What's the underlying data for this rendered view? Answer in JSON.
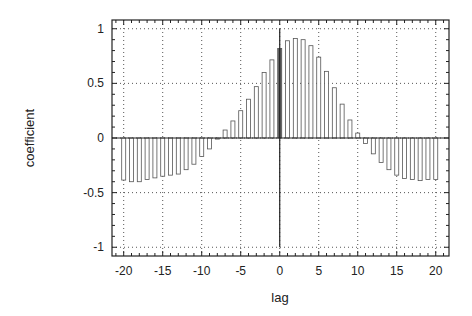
{
  "chart_data": {
    "type": "bar",
    "title": "",
    "xlabel": "lag",
    "ylabel": "coefficient",
    "xlim": [
      -21.5,
      21.7
    ],
    "ylim": [
      -1.08,
      1.08
    ],
    "xticks": [
      -20,
      -15,
      -10,
      -5,
      0,
      5,
      10,
      15,
      20
    ],
    "xtick_labels": [
      "-20",
      "-15",
      "-10",
      "-5",
      "0",
      "5",
      "10",
      "15",
      "20"
    ],
    "yticks": [
      1,
      0.5,
      0,
      -0.5,
      -1
    ],
    "ytick_labels": [
      "1",
      "0.5",
      "0",
      "-0.5",
      "-1"
    ],
    "grid": true,
    "grid_style": "dotted",
    "legend": null,
    "x": [
      -20,
      -19,
      -18,
      -17,
      -16,
      -15,
      -14,
      -13,
      -12,
      -11,
      -10,
      -9,
      -8,
      -7,
      -6,
      -5,
      -4,
      -3,
      -2,
      -1,
      0,
      1,
      2,
      3,
      4,
      5,
      6,
      7,
      8,
      9,
      10,
      11,
      12,
      13,
      14,
      15,
      16,
      17,
      18,
      19,
      20
    ],
    "values": [
      -0.385,
      -0.4,
      -0.4,
      -0.38,
      -0.365,
      -0.35,
      -0.34,
      -0.33,
      -0.29,
      -0.24,
      -0.17,
      -0.1,
      -0.01,
      0.073,
      0.156,
      0.25,
      0.355,
      0.47,
      0.6,
      0.715,
      0.82,
      0.89,
      0.91,
      0.9,
      0.845,
      0.74,
      0.61,
      0.46,
      0.31,
      0.165,
      0.045,
      -0.05,
      -0.145,
      -0.225,
      -0.29,
      -0.34,
      -0.37,
      -0.38,
      -0.39,
      -0.38,
      -0.38
    ],
    "highlight_lag": 0,
    "zero_vertical_line": true
  },
  "colors": {
    "frame": "#222222",
    "bar_stroke": "#555555",
    "bar_fill": "#ffffff",
    "highlight_fill": "#666666",
    "grid": "#555555"
  }
}
